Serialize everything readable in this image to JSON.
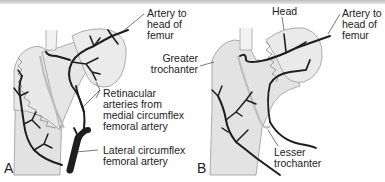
{
  "figure": {
    "panels": [
      {
        "letter": "A",
        "labels": {
          "artery_head_1": "Artery to",
          "artery_head_2": "head of",
          "artery_head_3": "femur",
          "retinacular_1": "Retinacular",
          "retinacular_2": "arteries from",
          "retinacular_3": "medial circumflex",
          "retinacular_4": "femoral artery",
          "lateral_1": "Lateral circumflex",
          "lateral_2": "femoral artery"
        }
      },
      {
        "letter": "B",
        "labels": {
          "head": "Head",
          "artery_head_1": "Artery to",
          "artery_head_2": "head of",
          "artery_head_3": "femur",
          "greater_1": "Greater",
          "greater_2": "trochanter",
          "lesser_1": "Lesser",
          "lesser_2": "trochanter"
        }
      }
    ],
    "colors": {
      "bone_fill": "#e4e4e4",
      "bone_light": "#efefef",
      "outline": "#8a8a8a",
      "artery": "#1e1e1e",
      "text": "#222222"
    }
  }
}
